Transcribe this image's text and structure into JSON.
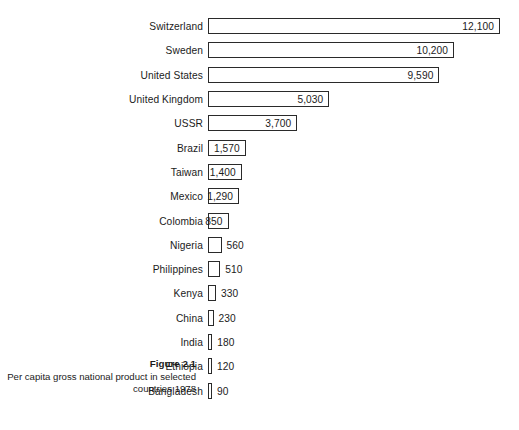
{
  "caption": {
    "title": "Figure 2.1",
    "body": "Per capita gross national product in selected countries 1978"
  },
  "chart_data": {
    "type": "bar",
    "orientation": "horizontal",
    "title": "Figure 2.1",
    "subtitle": "Per capita gross national product in selected countries 1978",
    "xlabel": "",
    "ylabel": "",
    "xlim": [
      0,
      12100
    ],
    "grid": false,
    "legend": null,
    "units": "US dollars per capita",
    "year": 1978,
    "categories": [
      "Switzerland",
      "Sweden",
      "United States",
      "United Kingdom",
      "USSR",
      "Brazil",
      "Taiwan",
      "Mexico",
      "Colombia",
      "Nigeria",
      "Philippines",
      "Kenya",
      "China",
      "India",
      "Ethiopia",
      "Bangladesh"
    ],
    "values": [
      12100,
      10200,
      9590,
      5030,
      3700,
      1570,
      1400,
      1290,
      850,
      560,
      510,
      330,
      230,
      180,
      120,
      90
    ],
    "value_labels": [
      "12,100",
      "10,200",
      "9,590",
      "5,030",
      "3,700",
      "1,570",
      "1,400",
      "1,290",
      "850",
      "560",
      "510",
      "330",
      "230",
      "180",
      "120",
      "90"
    ],
    "label_placement": [
      "inside",
      "inside",
      "inside",
      "inside",
      "inside",
      "inside",
      "inside",
      "inside",
      "inside",
      "outside",
      "outside",
      "outside",
      "outside",
      "outside",
      "outside",
      "outside"
    ]
  },
  "colors": {
    "bar_fill": "#ffffff",
    "bar_stroke": "#2a2a2a",
    "text": "#1b1b1b",
    "background": "#ffffff"
  }
}
